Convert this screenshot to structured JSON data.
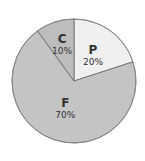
{
  "chart_data": {
    "type": "pie",
    "title": "",
    "start_angle_deg": 0,
    "direction": "clockwise",
    "categories": [
      "P",
      "F",
      "C"
    ],
    "values": [
      20,
      70,
      10
    ],
    "labels": [
      "20%",
      "70%",
      "10%"
    ],
    "colors": [
      "#f0f0f0",
      "#c4c4c4",
      "#bdbdbd"
    ],
    "border_color": "#666666",
    "legend": "none"
  },
  "geometry": {
    "cx": 74,
    "cy": 81,
    "r": 62
  }
}
